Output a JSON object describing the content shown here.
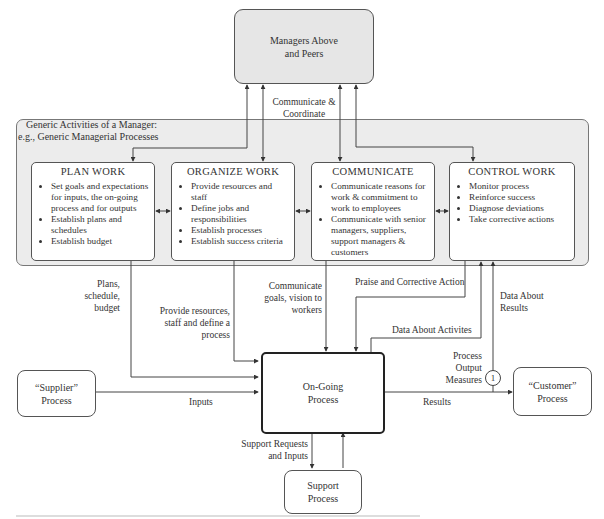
{
  "managers_box": {
    "label_line1": "Managers Above",
    "label_line2": "and Peers"
  },
  "communicate_coordinate": {
    "line1": "Communicate &",
    "line2": "Coordinate"
  },
  "group": {
    "title_line1": "Generic Activities of a Manager:",
    "title_line2": "e.g., Generic Managerial Processes"
  },
  "activities": [
    {
      "title": "PLAN WORK",
      "bullets": [
        "Set goals and expectations for inputs, the on-going process and for outputs",
        "Establish plans and schedules",
        "Establish budget"
      ]
    },
    {
      "title": "ORGANIZE WORK",
      "bullets": [
        "Provide resources and staff",
        "Define jobs and responsibilities",
        "Establish processes",
        "Establish success criteria"
      ]
    },
    {
      "title": "COMMUNICATE",
      "bullets": [
        "Communicate reasons for work & commitment to work to employees",
        "Communicate with senior managers, suppliers, support managers & customers"
      ]
    },
    {
      "title": "CONTROL WORK",
      "bullets": [
        "Monitor process",
        "Reinforce success",
        "Diagnose deviations",
        "Take corrective actions"
      ]
    }
  ],
  "flow_labels": {
    "plans": {
      "l1": "Plans,",
      "l2": "schedule,",
      "l3": "budget"
    },
    "provide": {
      "l1": "Provide resources,",
      "l2": "staff and define a",
      "l3": "process"
    },
    "communicate_goals": {
      "l1": "Communicate",
      "l2": "goals, vision to",
      "l3": "workers"
    },
    "praise": "Praise and Corrective Action",
    "data_activities": "Data About Activites",
    "data_results": {
      "l1": "Data About",
      "l2": "Results"
    },
    "process_output": {
      "l1": "Process",
      "l2": "Output",
      "l3": "Measures"
    },
    "measure_marker": "1",
    "inputs": "Inputs",
    "results": "Results",
    "support_requests": {
      "l1": "Support Requests",
      "l2": "and Inputs"
    }
  },
  "supplier_box": {
    "l1": "“Supplier”",
    "l2": "Process"
  },
  "ongoing_box": {
    "l1": "On-Going",
    "l2": "Process"
  },
  "customer_box": {
    "l1": "“Customer”",
    "l2": "Process"
  },
  "support_box": {
    "l1": "Support",
    "l2": "Process"
  }
}
